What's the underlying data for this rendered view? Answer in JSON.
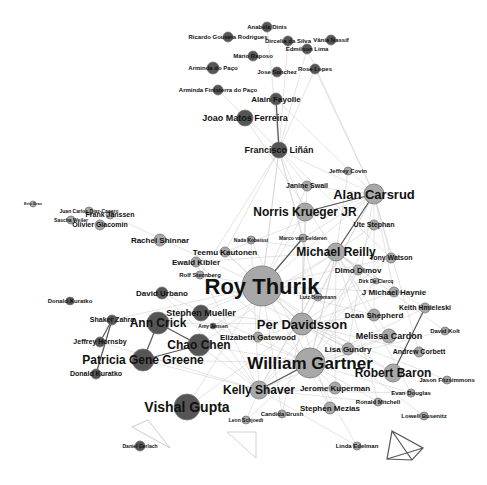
{
  "figure": {
    "type": "co-authorship network graph",
    "colors": {
      "light_node": "#a8a8a8",
      "dark_node": "#555555",
      "node_stroke": "#777777",
      "edge": "#c8c8c8",
      "strong_edge": "#555555",
      "label": "#111111"
    },
    "nodes": [
      {
        "id": "roy-thurik",
        "label": "Roy Thurik",
        "x": 262,
        "y": 286,
        "r": 20,
        "shade": "light",
        "fs": 22
      },
      {
        "id": "william-gartner",
        "label": "William Gartner",
        "x": 310,
        "y": 363,
        "r": 15,
        "shade": "light",
        "fs": 17
      },
      {
        "id": "per-davidsson",
        "label": "Per Davidsson",
        "x": 302,
        "y": 324,
        "r": 11,
        "shade": "light",
        "fs": 13
      },
      {
        "id": "alan-carsrud",
        "label": "Alan Carsrud",
        "x": 374,
        "y": 194,
        "r": 10,
        "shade": "light",
        "fs": 13
      },
      {
        "id": "norris-krueger",
        "label": "Norris Krueger JR",
        "x": 305,
        "y": 212,
        "r": 9,
        "shade": "light",
        "fs": 12
      },
      {
        "id": "michael-reilly",
        "label": "Michael Reilly",
        "x": 336,
        "y": 252,
        "r": 9,
        "shade": "light",
        "fs": 12
      },
      {
        "id": "robert-baron",
        "label": "Robert Baron",
        "x": 393,
        "y": 373,
        "r": 9,
        "shade": "light",
        "fs": 12
      },
      {
        "id": "kelly-shaver",
        "label": "Kelly Shaver",
        "x": 259,
        "y": 390,
        "r": 9,
        "shade": "light",
        "fs": 12
      },
      {
        "id": "vishal-gupta",
        "label": "Vishal Gupta",
        "x": 187,
        "y": 407,
        "r": 13,
        "shade": "dark",
        "fs": 14
      },
      {
        "id": "chao-chen",
        "label": "Chao Chen",
        "x": 199,
        "y": 345,
        "r": 11,
        "shade": "dark",
        "fs": 12
      },
      {
        "id": "ann-crick",
        "label": "Ann Crick",
        "x": 158,
        "y": 323,
        "r": 11,
        "shade": "dark",
        "fs": 12
      },
      {
        "id": "patricia-gene-greene",
        "label": "Patricia Gene Greene",
        "x": 143,
        "y": 360,
        "r": 11,
        "shade": "dark",
        "fs": 12
      },
      {
        "id": "stephen-mueller",
        "label": "Stephen Mueller",
        "x": 201,
        "y": 313,
        "r": 8,
        "shade": "dark",
        "fs": 9
      },
      {
        "id": "david-urbano",
        "label": "David Urbano",
        "x": 162,
        "y": 293,
        "r": 6,
        "shade": "dark",
        "fs": 8
      },
      {
        "id": "shaker-zahra",
        "label": "Shaker Zahra",
        "x": 112,
        "y": 320,
        "r": 5,
        "shade": "dark",
        "fs": 7
      },
      {
        "id": "jeffrey-hornsby",
        "label": "Jeffrey Hornsby",
        "x": 100,
        "y": 342,
        "r": 5,
        "shade": "dark",
        "fs": 7
      },
      {
        "id": "donald-kuratko",
        "label": "Donald Kuratko",
        "x": 96,
        "y": 374,
        "r": 5,
        "shade": "dark",
        "fs": 7
      },
      {
        "id": "donald-kuratko-2",
        "label": "Donald Kuratko",
        "x": 70,
        "y": 301,
        "r": 4,
        "shade": "dark",
        "fs": 6
      },
      {
        "id": "francisco-linan",
        "label": "Francisco Liñán",
        "x": 279,
        "y": 150,
        "r": 8,
        "shade": "dark",
        "fs": 9
      },
      {
        "id": "joao-matos-ferreira",
        "label": "Joao Matos Ferreira",
        "x": 245,
        "y": 118,
        "r": 8,
        "shade": "dark",
        "fs": 9
      },
      {
        "id": "alain-fayolle",
        "label": "Alain Fayolle",
        "x": 276,
        "y": 99,
        "r": 6,
        "shade": "dark",
        "fs": 8
      },
      {
        "id": "arminda-paco",
        "label": "Arminda do Paço",
        "x": 213,
        "y": 68,
        "r": 6,
        "shade": "dark",
        "fs": 6
      },
      {
        "id": "arminda-finisterra",
        "label": "Arminda Finisterra do Paço",
        "x": 218,
        "y": 90,
        "r": 5,
        "shade": "dark",
        "fs": 6
      },
      {
        "id": "ricardo-rodrigues",
        "label": "Ricardo Gouveia Rodrigues",
        "x": 228,
        "y": 37,
        "r": 5,
        "shade": "dark",
        "fs": 6
      },
      {
        "id": "anabela-dinis",
        "label": "Anabela Dinis",
        "x": 267,
        "y": 27,
        "r": 5,
        "shade": "dark",
        "fs": 6
      },
      {
        "id": "mario-raposo",
        "label": "Mário Raposo",
        "x": 253,
        "y": 56,
        "r": 5,
        "shade": "dark",
        "fs": 6
      },
      {
        "id": "dircelia-silva",
        "label": "Dircelia da Silva",
        "x": 288,
        "y": 41,
        "r": 5,
        "shade": "dark",
        "fs": 6
      },
      {
        "id": "vania-nassif",
        "label": "Vânia Nassif",
        "x": 331,
        "y": 40,
        "r": 5,
        "shade": "dark",
        "fs": 6
      },
      {
        "id": "edmilson-lima",
        "label": "Edmilson Lima",
        "x": 307,
        "y": 49,
        "r": 5,
        "shade": "dark",
        "fs": 6
      },
      {
        "id": "joao-sanchez",
        "label": "Jose Sanchez",
        "x": 277,
        "y": 72,
        "r": 5,
        "shade": "dark",
        "fs": 6
      },
      {
        "id": "rose-lopes",
        "label": "Rose Lopes",
        "x": 315,
        "y": 69,
        "r": 5,
        "shade": "dark",
        "fs": 6
      },
      {
        "id": "jeffrey-covin",
        "label": "Jeffrey Covin",
        "x": 348,
        "y": 171,
        "r": 4,
        "shade": "light",
        "fs": 6
      },
      {
        "id": "janine-swail",
        "label": "Janine Swail",
        "x": 307,
        "y": 186,
        "r": 5,
        "shade": "light",
        "fs": 7
      },
      {
        "id": "ute-stephan",
        "label": "Ute Stephan",
        "x": 374,
        "y": 225,
        "r": 5,
        "shade": "light",
        "fs": 7
      },
      {
        "id": "tony-watson",
        "label": "Tony Watson",
        "x": 391,
        "y": 258,
        "r": 5,
        "shade": "light",
        "fs": 7
      },
      {
        "id": "dimo-dimov",
        "label": "Dimo Dimov",
        "x": 358,
        "y": 270,
        "r": 5,
        "shade": "light",
        "fs": 8
      },
      {
        "id": "j-michael-haynie",
        "label": "J Michael Haynie",
        "x": 394,
        "y": 292,
        "r": 5,
        "shade": "light",
        "fs": 8
      },
      {
        "id": "keith-hmieleski",
        "label": "Keith Hmieleski",
        "x": 425,
        "y": 308,
        "r": 5,
        "shade": "light",
        "fs": 7
      },
      {
        "id": "dean-shepherd",
        "label": "Dean Shepherd",
        "x": 374,
        "y": 315,
        "r": 6,
        "shade": "light",
        "fs": 8
      },
      {
        "id": "melissa-cardon",
        "label": "Melissa Cardon",
        "x": 389,
        "y": 336,
        "r": 7,
        "shade": "light",
        "fs": 9
      },
      {
        "id": "andrew-corbett",
        "label": "Andrew Corbett",
        "x": 419,
        "y": 352,
        "r": 5,
        "shade": "light",
        "fs": 7
      },
      {
        "id": "david-kolt",
        "label": "David Kolt",
        "x": 445,
        "y": 331,
        "r": 4,
        "shade": "light",
        "fs": 6
      },
      {
        "id": "jason-fitzsimmons",
        "label": "Jason Fitzsimmons",
        "x": 447,
        "y": 380,
        "r": 4,
        "shade": "light",
        "fs": 6
      },
      {
        "id": "evan-douglas",
        "label": "Evan Douglas",
        "x": 411,
        "y": 393,
        "r": 4,
        "shade": "light",
        "fs": 6
      },
      {
        "id": "lowell-busenitz",
        "label": "Lowell Busenitz",
        "x": 424,
        "y": 416,
        "r": 4,
        "shade": "light",
        "fs": 6
      },
      {
        "id": "ronald-mitchell",
        "label": "Ronald Mitchell",
        "x": 378,
        "y": 402,
        "r": 4,
        "shade": "light",
        "fs": 6
      },
      {
        "id": "lisa-gundry",
        "label": "Lisa Gundry",
        "x": 348,
        "y": 349,
        "r": 6,
        "shade": "light",
        "fs": 8
      },
      {
        "id": "jerome-kuperman",
        "label": "Jerome Kuperman",
        "x": 335,
        "y": 388,
        "r": 6,
        "shade": "light",
        "fs": 8
      },
      {
        "id": "stephen-mezias",
        "label": "Stephen Mezias",
        "x": 330,
        "y": 408,
        "r": 6,
        "shade": "light",
        "fs": 8
      },
      {
        "id": "linda-edelman",
        "label": "Linda Edelman",
        "x": 357,
        "y": 446,
        "r": 4,
        "shade": "light",
        "fs": 6
      },
      {
        "id": "candida-brush",
        "label": "Candida Brush",
        "x": 282,
        "y": 414,
        "r": 4,
        "shade": "light",
        "fs": 6
      },
      {
        "id": "leon-schjoedt",
        "label": "Leon Schjoedt",
        "x": 246,
        "y": 420,
        "r": 4,
        "shade": "light",
        "fs": 5
      },
      {
        "id": "elizabeth-gatewood",
        "label": "Elizabeth Gatewood",
        "x": 258,
        "y": 337,
        "r": 5,
        "shade": "light",
        "fs": 8
      },
      {
        "id": "rachel-shinnar",
        "label": "Rachel Shinnar",
        "x": 160,
        "y": 240,
        "r": 6,
        "shade": "light",
        "fs": 8
      },
      {
        "id": "teemu-kautonen",
        "label": "Teemu Kautonen",
        "x": 225,
        "y": 252,
        "r": 5,
        "shade": "light",
        "fs": 8
      },
      {
        "id": "ewald-kibler",
        "label": "Ewald Kibler",
        "x": 196,
        "y": 262,
        "r": 5,
        "shade": "light",
        "fs": 8
      },
      {
        "id": "rolf-sternberg",
        "label": "Rolf Sternberg",
        "x": 200,
        "y": 275,
        "r": 4,
        "shade": "light",
        "fs": 6
      },
      {
        "id": "nada-kobeissi",
        "label": "Nada Kobeissi",
        "x": 251,
        "y": 240,
        "r": 4,
        "shade": "light",
        "fs": 5
      },
      {
        "id": "marco-van-gelderen",
        "label": "Marco van Gelderen",
        "x": 303,
        "y": 238,
        "r": 4,
        "shade": "light",
        "fs": 5
      },
      {
        "id": "olivier-giacomin",
        "label": "Olivier Giacomin",
        "x": 100,
        "y": 225,
        "r": 5,
        "shade": "light",
        "fs": 7
      },
      {
        "id": "frank-janssen",
        "label": "Frank Janssen",
        "x": 110,
        "y": 215,
        "r": 4,
        "shade": "light",
        "fs": 7
      },
      {
        "id": "juan-carlos-diaz",
        "label": "Juan Carlos Díaz-Casero",
        "x": 89,
        "y": 211,
        "r": 4,
        "shade": "light",
        "fs": 5
      },
      {
        "id": "sascha-weiler",
        "label": "Sascha Weiler",
        "x": 71,
        "y": 220,
        "r": 4,
        "shade": "light",
        "fs": 5
      },
      {
        "id": "eric-gras",
        "label": "Eric Gras",
        "x": 33,
        "y": 204,
        "r": 3,
        "shade": "light",
        "fs": 4
      },
      {
        "id": "lutz-bornmann",
        "label": "Lutz Bornmann",
        "x": 318,
        "y": 297,
        "r": 4,
        "shade": "light",
        "fs": 5
      },
      {
        "id": "dirk-de-clercq",
        "label": "Dirk De Clercq",
        "x": 376,
        "y": 281,
        "r": 3,
        "shade": "light",
        "fs": 5
      },
      {
        "id": "daniel-gerlach",
        "label": "Daniel Gerlach",
        "x": 140,
        "y": 446,
        "r": 5,
        "shade": "dark",
        "fs": 5
      },
      {
        "id": "ashley-jensen",
        "label": "Amy Jensen",
        "x": 213,
        "y": 326,
        "r": 3,
        "shade": "dark",
        "fs": 5
      }
    ],
    "caption_partial": "Figure (caption cut off at bottom edge)"
  }
}
